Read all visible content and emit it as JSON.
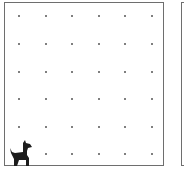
{
  "game": {
    "grid": {
      "columns": 6,
      "rows": 6,
      "dot_x": [
        14,
        41,
        67,
        94,
        120,
        147
      ],
      "dot_y": [
        13,
        41,
        69,
        96,
        124,
        151
      ]
    },
    "player": {
      "icon": "dog-icon",
      "column": 0,
      "row": 5
    },
    "colors": {
      "border": "#6e6e6e",
      "dot": "#555555",
      "dog": "#1c1c1c"
    }
  }
}
